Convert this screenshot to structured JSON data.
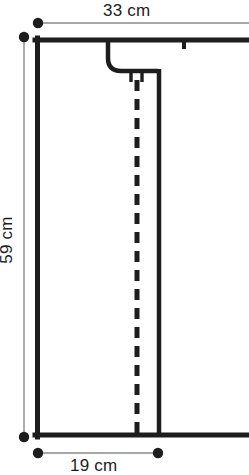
{
  "diagram": {
    "units": "cm",
    "colors": {
      "outline": "#1d1d1d",
      "dimension_line": "#8a8a8a",
      "dimension_dot": "#1d1d1d",
      "background": "#ffffff",
      "text": "#1d1d1d"
    },
    "dimensions": [
      {
        "id": "top-width",
        "label": "33 cm",
        "value": 33,
        "unit": "cm",
        "orientation": "horizontal",
        "position": "top"
      },
      {
        "id": "left-height",
        "label": "59 cm",
        "value": 59,
        "unit": "cm",
        "orientation": "vertical",
        "position": "left"
      },
      {
        "id": "bottom-width",
        "label": "19 cm",
        "value": 19,
        "unit": "cm",
        "orientation": "horizontal",
        "position": "bottom"
      }
    ],
    "features": [
      {
        "id": "top-notch-tick",
        "type": "notch-mark",
        "edge": "top"
      },
      {
        "id": "curved-hook-cutout",
        "type": "curved-cutout",
        "edge": "top-interior"
      },
      {
        "id": "center-tab",
        "type": "small-tab",
        "edge": "interior"
      },
      {
        "id": "fold-line",
        "type": "dashed-line",
        "orientation": "vertical"
      },
      {
        "id": "seam-line",
        "type": "solid-line",
        "orientation": "vertical"
      }
    ]
  }
}
